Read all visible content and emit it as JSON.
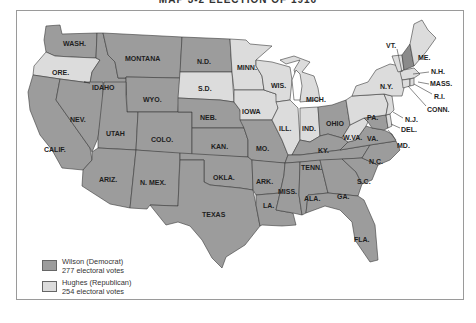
{
  "title": "MAP 3-2   ELECTION OF 1916",
  "colors": {
    "democrat": "#9c9c9c",
    "republican": "#dcdcdc",
    "nh_highlight": "#8a8a8a",
    "water": "#ffffff",
    "border": "#3a3a3a"
  },
  "legend": {
    "wilson": {
      "label": "Wilson (Democrat)",
      "votes": "277 electoral votes",
      "party": "democrat"
    },
    "hughes": {
      "label": "Hughes (Republican)",
      "votes": "254 electoral votes",
      "party": "republican"
    }
  },
  "states": {
    "wash": {
      "label": "WASH.",
      "party": "democrat"
    },
    "ore": {
      "label": "ORE.",
      "party": "republican"
    },
    "calif": {
      "label": "CALIF.",
      "party": "democrat"
    },
    "idaho": {
      "label": "IDAHO",
      "party": "democrat"
    },
    "nev": {
      "label": "NEV.",
      "party": "democrat"
    },
    "montana": {
      "label": "MONTANA",
      "party": "democrat"
    },
    "wyo": {
      "label": "WYO.",
      "party": "democrat"
    },
    "utah": {
      "label": "UTAH",
      "party": "democrat"
    },
    "colo": {
      "label": "COLO.",
      "party": "democrat"
    },
    "ariz": {
      "label": "ARIZ.",
      "party": "democrat"
    },
    "nmex": {
      "label": "N. MEX.",
      "party": "democrat"
    },
    "nd": {
      "label": "N.D.",
      "party": "democrat"
    },
    "sd": {
      "label": "S.D.",
      "party": "republican"
    },
    "neb": {
      "label": "NEB.",
      "party": "democrat"
    },
    "kan": {
      "label": "KAN.",
      "party": "democrat"
    },
    "okla": {
      "label": "OKLA.",
      "party": "democrat"
    },
    "texas": {
      "label": "TEXAS",
      "party": "democrat"
    },
    "minn": {
      "label": "MINN.",
      "party": "republican"
    },
    "iowa": {
      "label": "IOWA",
      "party": "republican"
    },
    "mo": {
      "label": "MO.",
      "party": "democrat"
    },
    "ark": {
      "label": "ARK.",
      "party": "democrat"
    },
    "la": {
      "label": "LA.",
      "party": "democrat"
    },
    "wis": {
      "label": "WIS.",
      "party": "republican"
    },
    "ill": {
      "label": "ILL.",
      "party": "republican"
    },
    "mich": {
      "label": "MICH.",
      "party": "republican"
    },
    "ind": {
      "label": "IND.",
      "party": "republican"
    },
    "ohio": {
      "label": "OHIO",
      "party": "democrat"
    },
    "ky": {
      "label": "KY.",
      "party": "democrat"
    },
    "tenn": {
      "label": "TENN.",
      "party": "democrat"
    },
    "miss": {
      "label": "MISS.",
      "party": "democrat"
    },
    "ala": {
      "label": "ALA.",
      "party": "democrat"
    },
    "ga": {
      "label": "GA.",
      "party": "democrat"
    },
    "fla": {
      "label": "FLA.",
      "party": "democrat"
    },
    "sc": {
      "label": "S.C.",
      "party": "democrat"
    },
    "nc": {
      "label": "N.C.",
      "party": "democrat"
    },
    "va": {
      "label": "VA.",
      "party": "democrat"
    },
    "wva": {
      "label": "W.VA.",
      "party": "republican"
    },
    "md": {
      "label": "MD.",
      "party": "democrat"
    },
    "del": {
      "label": "DEL.",
      "party": "republican"
    },
    "pa": {
      "label": "PA.",
      "party": "republican"
    },
    "nj": {
      "label": "N.J.",
      "party": "republican"
    },
    "ny": {
      "label": "N.Y.",
      "party": "republican"
    },
    "conn": {
      "label": "CONN.",
      "party": "republican"
    },
    "ri": {
      "label": "R.I.",
      "party": "republican"
    },
    "mass": {
      "label": "MASS.",
      "party": "republican"
    },
    "vt": {
      "label": "VT.",
      "party": "republican"
    },
    "nh": {
      "label": "N.H.",
      "party": "democrat"
    },
    "me": {
      "label": "ME.",
      "party": "republican"
    }
  }
}
